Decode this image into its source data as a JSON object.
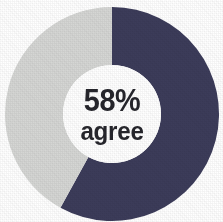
{
  "chart_data": {
    "type": "pie",
    "variant": "donut",
    "title": "",
    "subtitle": "",
    "xlabel": "",
    "ylabel": "",
    "legend": false,
    "legend_position": "none",
    "grid": false,
    "center_label": {
      "value": "58%",
      "caption": "agree"
    },
    "units": "percent",
    "total": 100,
    "start_angle_deg": 0,
    "direction": "clockwise",
    "categories": [
      "agree",
      "other"
    ],
    "values": [
      58,
      42
    ],
    "labels": [
      "58%",
      "42%"
    ],
    "slices": [
      {
        "name": "agree",
        "value": 58,
        "label": "58%",
        "color": "#3c3c5a",
        "start_angle_deg": 0,
        "end_angle_deg": 208.8
      },
      {
        "name": "other",
        "value": 42,
        "label": "42%",
        "color": "#d5d6d4",
        "start_angle_deg": 208.8,
        "end_angle_deg": 360
      }
    ]
  },
  "figure": {
    "background_color": "#ffffff",
    "center_x": 112,
    "center_y": 114,
    "outer_radius": 107,
    "inner_radius": 49,
    "hole_color": "#ffffff",
    "text_color": "#25252b"
  }
}
